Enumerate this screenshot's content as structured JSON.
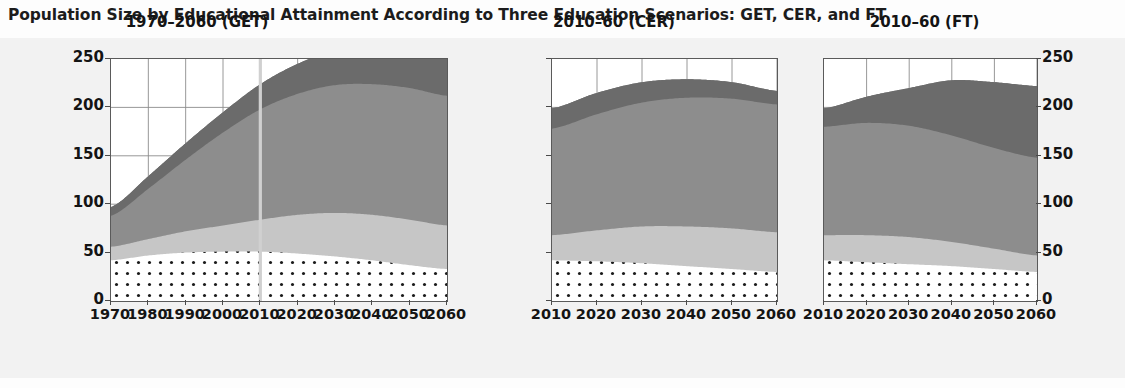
{
  "figure": {
    "title": "Population Size by Educational Attainment According to Three Education Scenarios: GET, CER, and FT",
    "ylabel": "Population (millions)",
    "background": "#f2f2f2",
    "plot_background": "#ffffff",
    "frame_color": "#5a5a5a"
  },
  "axis": {
    "yticks": [
      "0",
      "50",
      "100",
      "150",
      "200",
      "250"
    ],
    "ymin": 0,
    "ymax": 250,
    "ystep": 50,
    "left_axis_labels": [
      "250",
      "200",
      "150",
      "100",
      "50",
      "0"
    ],
    "right_axis_labels": [
      "250",
      "200",
      "150",
      "100",
      "50",
      "0"
    ]
  },
  "series_styles": [
    {
      "name": "lowest-education",
      "fill": "#ffffff",
      "pattern": "dots",
      "dot_color": "#1a1a1a"
    },
    {
      "name": "lower-secondary",
      "fill": "#c6c6c6",
      "pattern": "solid",
      "dot_color": ""
    },
    {
      "name": "upper-secondary",
      "fill": "#8d8d8d",
      "pattern": "solid",
      "dot_color": ""
    },
    {
      "name": "post-secondary",
      "fill": "#6b6b6b",
      "pattern": "solid",
      "dot_color": ""
    }
  ],
  "chart_data": {
    "type": "area",
    "title": "Population Size by Educational Attainment According to Three Education Scenarios: GET, CER, and FT",
    "xlabel": "",
    "ylabel": "Population (millions)",
    "ylim": [
      0,
      250
    ],
    "grid": true,
    "legend_position": "none",
    "stacked": true,
    "panels": [
      {
        "name": "GET",
        "title": "1970–2060 (GET)",
        "xlim": [
          1970,
          2060
        ],
        "x": [
          1970,
          1980,
          1990,
          2000,
          2010,
          2020,
          2030,
          2040,
          2050,
          2060
        ],
        "xticks": [
          "1970",
          "1980",
          "1990",
          "2000",
          "2010",
          "2020",
          "2030",
          "2040",
          "2050",
          "2060"
        ],
        "marker_year": 2010,
        "series": [
          {
            "name": "lowest-education",
            "values": [
              42,
              47,
              50,
              51,
              51,
              49,
              46,
              42,
              37,
              33
            ]
          },
          {
            "name": "lower-secondary",
            "values": [
              14,
              17,
              22,
              27,
              33,
              40,
              45,
              47,
              47,
              45
            ]
          },
          {
            "name": "upper-secondary",
            "values": [
              32,
              52,
              74,
              96,
              114,
              125,
              132,
              135,
              136,
              134
            ]
          },
          {
            "name": "post-secondary",
            "values": [
              9,
              13,
              17,
              21,
              26,
              31,
              36,
              40,
              42,
              43
            ]
          }
        ],
        "totals": [
          97,
          129,
          163,
          195,
          224,
          245,
          259,
          264,
          262,
          255
        ]
      },
      {
        "name": "CER",
        "title": "2010–60 (CER)",
        "xlim": [
          2010,
          2060
        ],
        "x": [
          2010,
          2020,
          2030,
          2040,
          2050,
          2060
        ],
        "xticks": [
          "2010",
          "2020",
          "2030",
          "2040",
          "2050",
          "2060"
        ],
        "marker_year": null,
        "series": [
          {
            "name": "lowest-education",
            "values": [
              42,
              41,
              39,
              36,
              33,
              30
            ]
          },
          {
            "name": "lower-secondary",
            "values": [
              26,
              32,
              38,
              41,
              42,
              41
            ]
          },
          {
            "name": "upper-secondary",
            "values": [
              110,
              120,
              128,
              133,
              134,
              132
            ]
          },
          {
            "name": "post-secondary",
            "values": [
              21,
              22,
              21,
              19,
              17,
              14
            ]
          }
        ],
        "totals": [
          199,
          215,
          226,
          229,
          226,
          217
        ]
      },
      {
        "name": "FT",
        "title": "2010–60 (FT)",
        "xlim": [
          2010,
          2060
        ],
        "x": [
          2010,
          2020,
          2030,
          2040,
          2050,
          2060
        ],
        "xticks": [
          "2010",
          "2020",
          "2030",
          "2040",
          "2050",
          "2060"
        ],
        "marker_year": null,
        "series": [
          {
            "name": "lowest-education",
            "values": [
              42,
              40,
              38,
              36,
              33,
              30
            ]
          },
          {
            "name": "lower-secondary",
            "values": [
              26,
              28,
              28,
              25,
              21,
              17
            ]
          },
          {
            "name": "upper-secondary",
            "values": [
              112,
              116,
              115,
              110,
              104,
              101
            ]
          },
          {
            "name": "post-secondary",
            "values": [
              19,
              27,
              39,
              57,
              68,
              74
            ]
          }
        ],
        "totals": [
          199,
          211,
          220,
          228,
          226,
          222
        ]
      }
    ]
  }
}
